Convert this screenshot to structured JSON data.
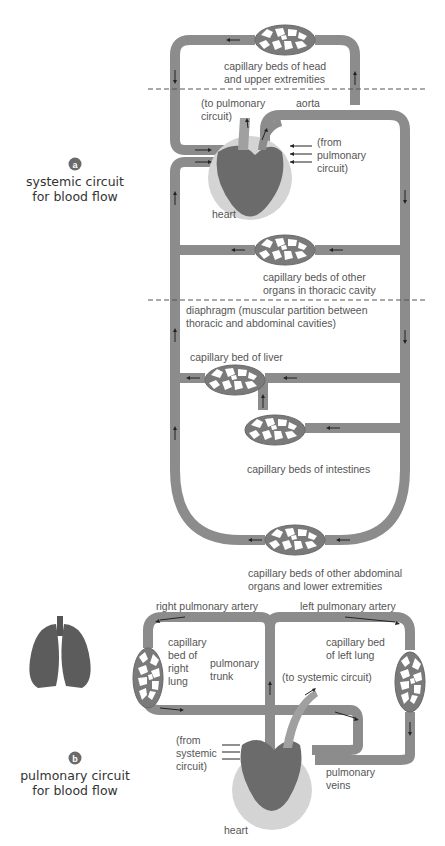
{
  "panel_a": {
    "badge": "a",
    "title_line1": "systemic circuit",
    "title_line2": "for blood flow",
    "labels": {
      "head_beds_1": "capillary beds of head",
      "head_beds_2": "and upper extremities",
      "to_pulmonary_1": "(to pulmonary",
      "to_pulmonary_2": "circuit)",
      "aorta": "aorta",
      "from_pulmonary_1": "(from",
      "from_pulmonary_2": "pulmonary",
      "from_pulmonary_3": "circuit)",
      "heart": "heart",
      "thoracic_beds_1": "capillary beds of other",
      "thoracic_beds_2": "organs in thoracic cavity",
      "diaphragm_1": "diaphragm (muscular partition between",
      "diaphragm_2": "thoracic and abdominal cavities)",
      "liver_bed": "capillary bed of liver",
      "intestine_beds": "capillary beds of intestines",
      "abdominal_beds_1": "capillary beds of other abdominal",
      "abdominal_beds_2": "organs and lower extremities"
    }
  },
  "panel_b": {
    "badge": "b",
    "title_line1": "pulmonary circuit",
    "title_line2": "for blood flow",
    "labels": {
      "right_artery": "right pulmonary artery",
      "left_artery": "left pulmonary artery",
      "right_lung_bed_1": "capillary",
      "right_lung_bed_2": "bed of",
      "right_lung_bed_3": "right",
      "right_lung_bed_4": "lung",
      "trunk_1": "pulmonary",
      "trunk_2": "trunk",
      "left_lung_bed_1": "capillary bed",
      "left_lung_bed_2": "of left lung",
      "to_systemic": "(to systemic circuit)",
      "from_systemic_1": "(from",
      "from_systemic_2": "systemic",
      "from_systemic_3": "circuit)",
      "veins_1": "pulmonary",
      "veins_2": "veins",
      "heart": "heart"
    }
  },
  "colors": {
    "vessel": "#8c8c8c",
    "badge": "#6a6a6a",
    "text": "#555555",
    "heart": "#6b6b6b",
    "pericardium": "#d4d4d4"
  }
}
